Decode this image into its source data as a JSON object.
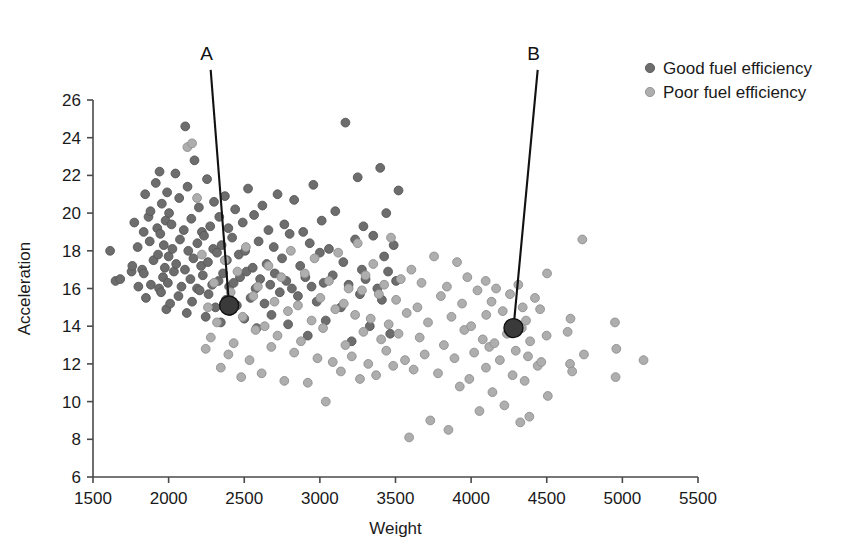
{
  "chart_data": {
    "type": "scatter",
    "title": "",
    "xlabel": "Weight",
    "ylabel": "Acceleration",
    "xlim": [
      1500,
      5500
    ],
    "ylim": [
      6,
      26
    ],
    "xticks": [
      1500,
      2000,
      2500,
      3000,
      3500,
      4000,
      4500,
      5000,
      5500
    ],
    "yticks": [
      6,
      8,
      10,
      12,
      14,
      16,
      18,
      20,
      22,
      24,
      26
    ],
    "grid": false,
    "legend_position": "top-right",
    "colors": {
      "good": "#6d6d6d",
      "poor": "#aeaeae",
      "highlight": "#3a3a3a",
      "axis": "#4a4a4a",
      "leader": "#111111"
    },
    "series": [
      {
        "name": "Good fuel efficiency",
        "color": "#6d6d6d",
        "marker": "circle",
        "points": [
          [
            1613,
            18.0
          ],
          [
            1649,
            16.4
          ],
          [
            1680,
            16.5
          ],
          [
            1755,
            16.9
          ],
          [
            1760,
            17.2
          ],
          [
            1773,
            19.5
          ],
          [
            1795,
            18.2
          ],
          [
            1800,
            16.1
          ],
          [
            1825,
            17.0
          ],
          [
            1835,
            19.0
          ],
          [
            1836,
            16.8
          ],
          [
            1845,
            21.0
          ],
          [
            1850,
            15.5
          ],
          [
            1867,
            19.8
          ],
          [
            1875,
            18.5
          ],
          [
            1880,
            20.1
          ],
          [
            1883,
            16.2
          ],
          [
            1900,
            17.5
          ],
          [
            1915,
            21.6
          ],
          [
            1925,
            19.2
          ],
          [
            1930,
            17.8
          ],
          [
            1937,
            16.0
          ],
          [
            1940,
            22.2
          ],
          [
            1945,
            18.9
          ],
          [
            1950,
            15.8
          ],
          [
            1955,
            20.5
          ],
          [
            1963,
            16.6
          ],
          [
            1968,
            18.3
          ],
          [
            1975,
            17.1
          ],
          [
            1980,
            19.6
          ],
          [
            1985,
            14.9
          ],
          [
            1990,
            21.1
          ],
          [
            1995,
            16.3
          ],
          [
            2000,
            17.7
          ],
          [
            2003,
            20.0
          ],
          [
            2010,
            15.2
          ],
          [
            2019,
            19.4
          ],
          [
            2025,
            18.1
          ],
          [
            2035,
            16.9
          ],
          [
            2045,
            22.1
          ],
          [
            2050,
            17.3
          ],
          [
            2065,
            15.6
          ],
          [
            2070,
            20.8
          ],
          [
            2075,
            18.6
          ],
          [
            2085,
            16.1
          ],
          [
            2100,
            19.1
          ],
          [
            2108,
            17.0
          ],
          [
            2110,
            24.6
          ],
          [
            2120,
            14.7
          ],
          [
            2125,
            21.4
          ],
          [
            2130,
            18.0
          ],
          [
            2144,
            16.5
          ],
          [
            2150,
            19.7
          ],
          [
            2155,
            15.3
          ],
          [
            2164,
            17.6
          ],
          [
            2171,
            22.8
          ],
          [
            2188,
            16.0
          ],
          [
            2190,
            18.4
          ],
          [
            2200,
            20.3
          ],
          [
            2205,
            15.9
          ],
          [
            2215,
            17.2
          ],
          [
            2220,
            19.0
          ],
          [
            2226,
            16.7
          ],
          [
            2234,
            18.8
          ],
          [
            2245,
            14.5
          ],
          [
            2254,
            21.8
          ],
          [
            2260,
            17.4
          ],
          [
            2264,
            15.7
          ],
          [
            2275,
            19.3
          ],
          [
            2288,
            16.2
          ],
          [
            2295,
            18.1
          ],
          [
            2300,
            20.6
          ],
          [
            2310,
            15.0
          ],
          [
            2320,
            17.9
          ],
          [
            2330,
            16.4
          ],
          [
            2335,
            19.8
          ],
          [
            2345,
            14.2
          ],
          [
            2350,
            18.3
          ],
          [
            2360,
            16.8
          ],
          [
            2372,
            20.9
          ],
          [
            2379,
            15.4
          ],
          [
            2385,
            17.5
          ],
          [
            2395,
            19.2
          ],
          [
            2400,
            16.1
          ],
          [
            2405,
            14.8
          ],
          [
            2420,
            18.7
          ],
          [
            2430,
            16.3
          ],
          [
            2440,
            20.2
          ],
          [
            2451,
            15.1
          ],
          [
            2464,
            17.8
          ],
          [
            2472,
            16.6
          ],
          [
            2490,
            19.5
          ],
          [
            2500,
            14.4
          ],
          [
            2506,
            18.0
          ],
          [
            2515,
            16.9
          ],
          [
            2525,
            21.3
          ],
          [
            2542,
            15.5
          ],
          [
            2556,
            17.1
          ],
          [
            2565,
            19.9
          ],
          [
            2575,
            16.0
          ],
          [
            2582,
            13.9
          ],
          [
            2595,
            18.5
          ],
          [
            2605,
            16.5
          ],
          [
            2620,
            20.4
          ],
          [
            2634,
            15.2
          ],
          [
            2648,
            17.3
          ],
          [
            2660,
            19.1
          ],
          [
            2672,
            16.2
          ],
          [
            2680,
            14.6
          ],
          [
            2695,
            18.2
          ],
          [
            2702,
            16.8
          ],
          [
            2720,
            21.0
          ],
          [
            2735,
            15.8
          ],
          [
            2750,
            17.6
          ],
          [
            2765,
            19.4
          ],
          [
            2778,
            16.4
          ],
          [
            2790,
            14.1
          ],
          [
            2800,
            18.9
          ],
          [
            2815,
            16.0
          ],
          [
            2830,
            20.7
          ],
          [
            2855,
            15.6
          ],
          [
            2870,
            17.2
          ],
          [
            2890,
            19.0
          ],
          [
            2904,
            16.6
          ],
          [
            2920,
            13.5
          ],
          [
            2933,
            18.4
          ],
          [
            2945,
            16.1
          ],
          [
            2957,
            21.5
          ],
          [
            2979,
            15.3
          ],
          [
            3000,
            17.9
          ],
          [
            3012,
            19.6
          ],
          [
            3025,
            16.3
          ],
          [
            3039,
            14.3
          ],
          [
            3060,
            18.1
          ],
          [
            3085,
            16.7
          ],
          [
            3102,
            20.1
          ],
          [
            3139,
            15.0
          ],
          [
            3155,
            17.4
          ],
          [
            3169,
            24.8
          ],
          [
            3190,
            16.2
          ],
          [
            3210,
            13.2
          ],
          [
            3233,
            18.6
          ],
          [
            3250,
            21.9
          ],
          [
            3265,
            15.7
          ],
          [
            3278,
            17.0
          ],
          [
            3288,
            19.3
          ],
          [
            3302,
            16.5
          ],
          [
            3330,
            14.0
          ],
          [
            3353,
            18.8
          ],
          [
            3380,
            16.0
          ],
          [
            3399,
            22.4
          ],
          [
            3410,
            15.4
          ],
          [
            3425,
            17.7
          ],
          [
            3439,
            20.0
          ],
          [
            3451,
            16.9
          ],
          [
            3465,
            13.6
          ],
          [
            3488,
            18.3
          ],
          [
            3504,
            16.4
          ],
          [
            3520,
            21.2
          ]
        ]
      },
      {
        "name": "Poor fuel efficiency",
        "color": "#aeaeae",
        "marker": "circle",
        "points": [
          [
            2124,
            23.5
          ],
          [
            2155,
            23.7
          ],
          [
            2188,
            20.8
          ],
          [
            2220,
            17.8
          ],
          [
            2245,
            12.8
          ],
          [
            2260,
            15.0
          ],
          [
            2279,
            13.4
          ],
          [
            2300,
            16.3
          ],
          [
            2320,
            14.2
          ],
          [
            2345,
            11.8
          ],
          [
            2371,
            17.5
          ],
          [
            2395,
            12.5
          ],
          [
            2410,
            15.8
          ],
          [
            2430,
            13.1
          ],
          [
            2455,
            16.9
          ],
          [
            2480,
            11.3
          ],
          [
            2490,
            14.5
          ],
          [
            2511,
            18.2
          ],
          [
            2535,
            12.2
          ],
          [
            2560,
            15.6
          ],
          [
            2575,
            13.8
          ],
          [
            2590,
            16.1
          ],
          [
            2615,
            11.5
          ],
          [
            2635,
            14.0
          ],
          [
            2660,
            17.2
          ],
          [
            2679,
            12.9
          ],
          [
            2700,
            15.3
          ],
          [
            2720,
            13.5
          ],
          [
            2745,
            16.6
          ],
          [
            2765,
            11.1
          ],
          [
            2789,
            14.8
          ],
          [
            2808,
            18.0
          ],
          [
            2830,
            12.6
          ],
          [
            2855,
            15.1
          ],
          [
            2875,
            13.2
          ],
          [
            2900,
            16.8
          ],
          [
            2920,
            11.0
          ],
          [
            2945,
            14.3
          ],
          [
            2965,
            17.6
          ],
          [
            2984,
            12.3
          ],
          [
            3003,
            15.5
          ],
          [
            3021,
            13.9
          ],
          [
            3039,
            10.0
          ],
          [
            3060,
            16.4
          ],
          [
            3085,
            12.1
          ],
          [
            3102,
            14.9
          ],
          [
            3121,
            17.9
          ],
          [
            3139,
            11.6
          ],
          [
            3158,
            15.2
          ],
          [
            3169,
            13.0
          ],
          [
            3190,
            16.0
          ],
          [
            3211,
            12.4
          ],
          [
            3233,
            14.6
          ],
          [
            3250,
            18.4
          ],
          [
            3265,
            11.2
          ],
          [
            3278,
            15.9
          ],
          [
            3288,
            13.7
          ],
          [
            3302,
            16.7
          ],
          [
            3320,
            12.0
          ],
          [
            3336,
            14.4
          ],
          [
            3353,
            17.3
          ],
          [
            3372,
            11.4
          ],
          [
            3390,
            15.7
          ],
          [
            3405,
            13.3
          ],
          [
            3425,
            16.2
          ],
          [
            3439,
            12.7
          ],
          [
            3455,
            14.1
          ],
          [
            3470,
            18.7
          ],
          [
            3485,
            11.9
          ],
          [
            3504,
            15.4
          ],
          [
            3520,
            13.6
          ],
          [
            3535,
            16.5
          ],
          [
            3563,
            12.2
          ],
          [
            3574,
            14.7
          ],
          [
            3590,
            8.1
          ],
          [
            3605,
            17.0
          ],
          [
            3620,
            11.7
          ],
          [
            3645,
            15.0
          ],
          [
            3660,
            13.4
          ],
          [
            3672,
            16.3
          ],
          [
            3693,
            12.5
          ],
          [
            3715,
            14.2
          ],
          [
            3730,
            9.0
          ],
          [
            3755,
            17.7
          ],
          [
            3781,
            11.5
          ],
          [
            3800,
            15.6
          ],
          [
            3820,
            13.0
          ],
          [
            3840,
            16.1
          ],
          [
            3850,
            8.5
          ],
          [
            3870,
            14.5
          ],
          [
            3890,
            12.3
          ],
          [
            3907,
            17.4
          ],
          [
            3925,
            10.8
          ],
          [
            3940,
            15.2
          ],
          [
            3955,
            13.8
          ],
          [
            3975,
            16.6
          ],
          [
            3988,
            11.2
          ],
          [
            4000,
            14.0
          ],
          [
            4020,
            12.6
          ],
          [
            4042,
            15.9
          ],
          [
            4055,
            9.5
          ],
          [
            4077,
            13.3
          ],
          [
            4096,
            16.4
          ],
          [
            4098,
            11.8
          ],
          [
            4100,
            14.6
          ],
          [
            4120,
            12.9
          ],
          [
            4135,
            15.3
          ],
          [
            4141,
            10.5
          ],
          [
            4154,
            13.1
          ],
          [
            4165,
            16.0
          ],
          [
            4190,
            12.2
          ],
          [
            4209,
            14.8
          ],
          [
            4220,
            9.8
          ],
          [
            4237,
            13.6
          ],
          [
            4257,
            15.7
          ],
          [
            4274,
            11.4
          ],
          [
            4288,
            14.1
          ],
          [
            4295,
            12.7
          ],
          [
            4312,
            16.2
          ],
          [
            4325,
            8.9
          ],
          [
            4335,
            13.9
          ],
          [
            4341,
            15.0
          ],
          [
            4354,
            11.1
          ],
          [
            4363,
            14.3
          ],
          [
            4376,
            12.4
          ],
          [
            4385,
            9.2
          ],
          [
            4390,
            13.2
          ],
          [
            4422,
            15.5
          ],
          [
            4440,
            11.9
          ],
          [
            4456,
            14.9
          ],
          [
            4464,
            12.1
          ],
          [
            4499,
            13.5
          ],
          [
            4502,
            16.8
          ],
          [
            4507,
            10.3
          ],
          [
            4638,
            13.7
          ],
          [
            4654,
            12.0
          ],
          [
            4657,
            14.4
          ],
          [
            4668,
            11.6
          ],
          [
            4735,
            18.6
          ],
          [
            4746,
            12.5
          ],
          [
            4951,
            14.2
          ],
          [
            4955,
            11.3
          ],
          [
            4960,
            12.8
          ],
          [
            5140,
            12.2
          ]
        ]
      }
    ],
    "annotations": [
      {
        "label": "A",
        "label_x": 2278,
        "label_y": 27.6,
        "point_x": 2400,
        "point_y": 15.1,
        "marker_size": 19
      },
      {
        "label": "B",
        "label_x": 4440,
        "label_y": 27.6,
        "point_x": 4280,
        "point_y": 13.9,
        "marker_size": 19
      }
    ],
    "legend": [
      {
        "label": "Good fuel efficiency",
        "color": "#6d6d6d"
      },
      {
        "label": "Poor fuel efficiency",
        "color": "#aeaeae"
      }
    ]
  }
}
